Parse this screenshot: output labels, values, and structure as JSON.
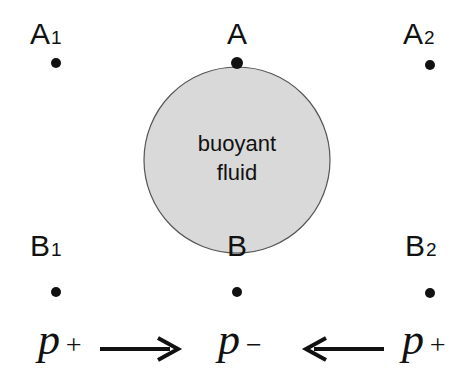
{
  "diagram": {
    "circle": {
      "label_line1": "buoyant",
      "label_line2": "fluid",
      "fill": "#d9d9d9",
      "stroke": "#555555"
    },
    "points": [
      {
        "id": "A1",
        "base": "A",
        "sub": "1"
      },
      {
        "id": "A",
        "base": "A",
        "sub": ""
      },
      {
        "id": "A2",
        "base": "A",
        "sub": "2"
      },
      {
        "id": "B1",
        "base": "B",
        "sub": "1"
      },
      {
        "id": "B",
        "base": "B",
        "sub": ""
      },
      {
        "id": "B2",
        "base": "B",
        "sub": "2"
      }
    ],
    "pressures": {
      "left": {
        "var": "p",
        "sign": "+"
      },
      "center": {
        "var": "p",
        "sign": "−"
      },
      "right": {
        "var": "p",
        "sign": "+"
      }
    },
    "arrows": [
      {
        "direction": "right",
        "from": "left",
        "to": "center"
      },
      {
        "direction": "left",
        "from": "right",
        "to": "center"
      }
    ]
  }
}
